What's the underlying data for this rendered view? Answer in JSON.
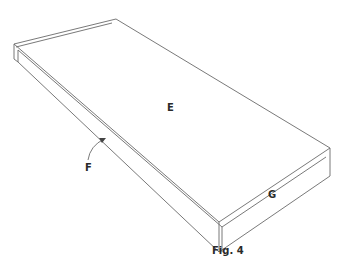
{
  "figure": {
    "caption": "Fig. 4",
    "labels": {
      "top_surface": "E",
      "side_edge": "F",
      "end_face": "G"
    },
    "colors": {
      "line": "#6a6a6a",
      "text": "#2a2a2a",
      "background": "#ffffff"
    }
  }
}
